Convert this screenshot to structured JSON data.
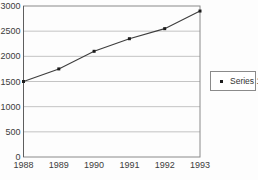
{
  "chart_data": {
    "type": "line",
    "categories": [
      "1988",
      "1989",
      "1990",
      "1991",
      "1992",
      "1993"
    ],
    "series": [
      {
        "name": "Series 1",
        "values": [
          1500,
          1750,
          2100,
          2350,
          2550,
          2900
        ],
        "marker": "square"
      }
    ],
    "xlabel": "",
    "ylabel": "",
    "ylim": [
      0,
      3000
    ],
    "yticks": [
      0,
      500,
      1000,
      1500,
      2000,
      2500,
      3000
    ],
    "grid": true,
    "legend": {
      "position": "right",
      "entries": [
        "Series 1"
      ]
    },
    "colors": {
      "line": "#3d3d3d",
      "marker": "#1c1c1c",
      "grid": "#b5b5b5",
      "border": "#8a8a8a",
      "axis": "#5e5e5e",
      "text": "#3c3c3c",
      "background": "#fdfdfd"
    }
  }
}
